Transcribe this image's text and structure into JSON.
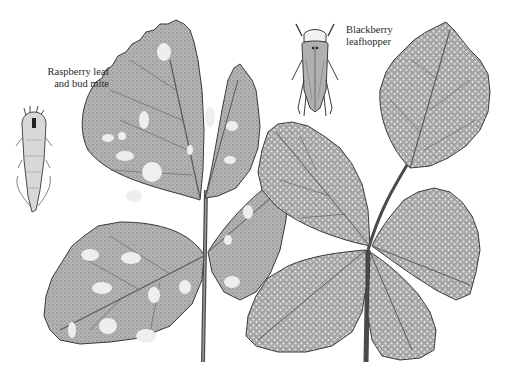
{
  "illustration": {
    "subject": "Raspberry and blackberry leaves with pest damage",
    "background_color": "#ffffff",
    "ink_color": "#3a3a3a",
    "leaf_fill": "#a9a9a9",
    "spot_color": "#efefef"
  },
  "labels": {
    "mite": {
      "line1": "Raspberry leaf",
      "line2": "and bud mite"
    },
    "leafhopper": {
      "line1": "Blackberry",
      "line2": "leafhopper"
    }
  },
  "figures": [
    {
      "name": "Raspberry leaf and bud mite",
      "icon": "mite-icon",
      "position": "left"
    },
    {
      "name": "Blackberry leafhopper",
      "icon": "leafhopper-icon",
      "position": "top-center"
    },
    {
      "name": "Raspberry leaf with blotch spots",
      "icon": "leaf-icon",
      "position": "left"
    },
    {
      "name": "Blackberry leaf with stippling",
      "icon": "leaf-icon",
      "position": "right"
    }
  ]
}
